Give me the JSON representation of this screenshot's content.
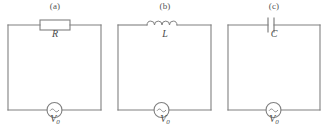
{
  "figure": {
    "background_color": "#ffffff",
    "line_color": "#808080",
    "text_color": "#4a4a4a",
    "panels": [
      {
        "id": "a",
        "panel_label": "(a)",
        "component_type": "resistor",
        "component_label": "R",
        "source_symbol": "~",
        "source_label": "V",
        "source_subscript": "0"
      },
      {
        "id": "b",
        "panel_label": "(b)",
        "component_type": "inductor",
        "component_label": "L",
        "source_symbol": "~",
        "source_label": "V",
        "source_subscript": "0"
      },
      {
        "id": "c",
        "panel_label": "(c)",
        "component_type": "capacitor",
        "component_label": "C",
        "source_symbol": "~",
        "source_label": "V",
        "source_subscript": "0"
      }
    ]
  }
}
